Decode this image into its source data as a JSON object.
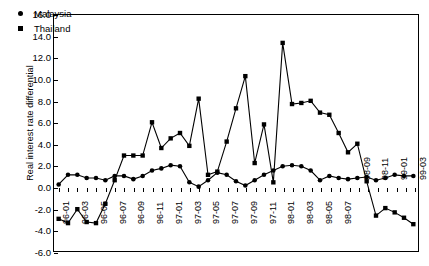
{
  "chart_data": {
    "type": "line",
    "title": "",
    "xlabel": "",
    "ylabel": "Real interest rate differential",
    "ylim": [
      -6.0,
      16.0
    ],
    "ytick_step": 2.0,
    "ytick_labels": [
      "16.0",
      "14.0",
      "12.0",
      "10.0",
      "8.0",
      "6.0",
      "4.0",
      "2.0",
      "0.0",
      "-2.0",
      "-4.0",
      "-6.0"
    ],
    "grid": false,
    "legend_position": "top-left",
    "x_tick_label_rotation": -90,
    "x_tick_label_interval": 2,
    "x": [
      "96-01",
      "96-02",
      "96-03",
      "96-04",
      "96-05",
      "96-06",
      "96-07",
      "96-08",
      "96-09",
      "96-10",
      "96-11",
      "96-12",
      "97-01",
      "97-02",
      "97-03",
      "97-04",
      "97-05",
      "97-06",
      "97-07",
      "97-08",
      "97-09",
      "97-10",
      "97-11",
      "97-12",
      "98-01",
      "98-02",
      "98-03",
      "98-04",
      "98-05",
      "98-06",
      "98-07",
      "98-08",
      "98-09",
      "98-10",
      "98-11",
      "98-12",
      "99-01",
      "99-02",
      "99-03"
    ],
    "xtick_labels": [
      "96-01",
      "96-03",
      "96-05",
      "96-07",
      "96-09",
      "96-11",
      "97-01",
      "97-03",
      "97-05",
      "97-07",
      "97-09",
      "97-11",
      "98-01",
      "98-03",
      "98-05",
      "98-07",
      "98-09",
      "98-11",
      "99-01",
      "99-03"
    ],
    "series": [
      {
        "name": "Malaysia",
        "marker": "circle",
        "values": [
          0.2,
          1.1,
          1.1,
          0.8,
          0.8,
          0.6,
          1.0,
          1.0,
          0.7,
          1.0,
          1.5,
          1.7,
          2.0,
          1.9,
          0.4,
          0.0,
          0.6,
          1.3,
          1.1,
          0.5,
          0.1,
          0.6,
          1.1,
          1.5,
          1.9,
          2.0,
          1.9,
          1.5,
          0.6,
          1.0,
          0.8,
          0.7,
          0.8,
          0.9,
          0.6,
          0.8,
          1.1,
          1.0,
          1.0
        ]
      },
      {
        "name": "Thailand",
        "marker": "square",
        "values": [
          -3.0,
          -3.4,
          -2.1,
          -3.3,
          -3.4,
          -1.6,
          0.6,
          2.9,
          2.9,
          2.9,
          6.0,
          3.6,
          4.5,
          5.0,
          3.8,
          8.2,
          1.1,
          1.4,
          4.2,
          7.3,
          10.3,
          2.2,
          5.8,
          0.4,
          13.4,
          7.7,
          7.8,
          8.0,
          6.9,
          6.7,
          5.0,
          3.2,
          4.0,
          0.5,
          -2.7,
          -2.0,
          -2.4,
          -2.9,
          -3.5
        ]
      }
    ],
    "series_note": "Malaysia values here are the low flat circle series; Thailand is the volatile square series"
  },
  "legend": {
    "items": [
      {
        "label": "Malaysia",
        "marker": "circle-marker"
      },
      {
        "label": "Thailand",
        "marker": "square-marker"
      }
    ]
  }
}
